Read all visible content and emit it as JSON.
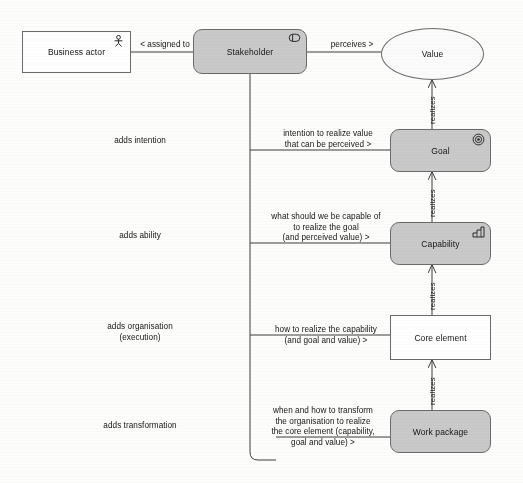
{
  "diagram": {
    "background_color": "#fdfdfc",
    "grey_fill": "#c9c9c9",
    "white_fill": "#ffffff",
    "stroke_color": "#6b6b6b"
  },
  "nodes": {
    "business_actor": {
      "label": "Business actor",
      "icon": "business-actor-icon",
      "fill": "#ffffff",
      "shape": "rectangle"
    },
    "stakeholder": {
      "label": "Stakeholder",
      "icon": "stakeholder-icon",
      "fill": "#c9c9c9",
      "shape": "rounded-rectangle"
    },
    "value": {
      "label": "Value",
      "icon": "none",
      "fill": "#fbfbfb",
      "shape": "ellipse"
    },
    "goal": {
      "label": "Goal",
      "icon": "goal-target-icon",
      "fill": "#c9c9c9",
      "shape": "rounded-rectangle"
    },
    "capability": {
      "label": "Capability",
      "icon": "capability-stairs-icon",
      "fill": "#c9c9c9",
      "shape": "rounded-rectangle"
    },
    "core_element": {
      "label": "Core element",
      "icon": "none",
      "fill": "#ffffff",
      "shape": "rectangle"
    },
    "work_package": {
      "label": "Work package",
      "icon": "none",
      "fill": "#c9c9c9",
      "shape": "rounded-rectangle"
    }
  },
  "relations": {
    "assigned_to": "< assigned to",
    "perceives": "perceives >",
    "realizes_value": "realizes",
    "realizes_goal": "realizes",
    "realizes_capability": "realizes",
    "realizes_core_element": "realizes"
  },
  "stage_labels": {
    "intention": "adds intention",
    "ability": "adds ability",
    "organisation_line1": "adds organisation",
    "organisation_line2": "(execution)",
    "transformation": "adds transformation"
  },
  "questions": {
    "intention": "intention to realize value\nthat can be perceived >",
    "ability": "what should we be capable of\nto realize the goal\n(and perceived value) >",
    "organisation": "how to realize the capability\n(and goal and value) >",
    "transformation": "when and how to transform\nthe organisation to realize\nthe core element (capability,\ngoal and value) >"
  }
}
